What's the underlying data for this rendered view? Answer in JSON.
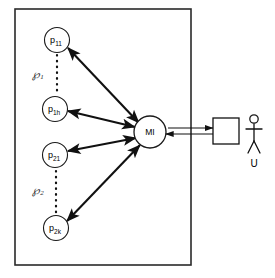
{
  "diagram": {
    "type": "node-link-diagram",
    "background_color": "#ffffff",
    "stroke_color": "#111111",
    "frame": {
      "name": "system-boundary",
      "x": 15,
      "y": 9,
      "width": 176,
      "height": 256
    },
    "provider_nodes": [
      {
        "id": "p11",
        "base": "p",
        "subscript": "11",
        "cx": 57,
        "cy": 40,
        "r": 12.5,
        "group": "P1"
      },
      {
        "id": "p1h",
        "base": "p",
        "subscript": "1h",
        "cx": 55,
        "cy": 109,
        "r": 12.5,
        "group": "P1"
      },
      {
        "id": "p21",
        "base": "p",
        "subscript": "21",
        "cx": 55,
        "cy": 155,
        "r": 12.5,
        "group": "P2"
      },
      {
        "id": "p2k",
        "base": "p",
        "subscript": "2k",
        "cx": 56,
        "cy": 228,
        "r": 12.5,
        "group": "P2"
      }
    ],
    "group_labels": [
      {
        "id": "P1",
        "base": "℘",
        "subscript": "1",
        "x": 38,
        "y": 74
      },
      {
        "id": "P2",
        "base": "℘",
        "subscript": "2",
        "x": 38,
        "y": 190
      }
    ],
    "ellipsis_links": [
      {
        "id": "dots-p1",
        "x": 57,
        "y1": 55,
        "y2": 95
      },
      {
        "id": "dots-p2",
        "x": 56,
        "y1": 170,
        "y2": 213
      }
    ],
    "mediator": {
      "id": "MI",
      "label": "MI",
      "cx": 150,
      "cy": 132,
      "r": 16
    },
    "edges": [
      {
        "id": "edge-p11-mi",
        "from": "p11",
        "to": "MI",
        "arrow": "bidirectional"
      },
      {
        "id": "edge-p1h-mi",
        "from": "p1h",
        "to": "MI",
        "arrow": "bidirectional"
      },
      {
        "id": "edge-p21-mi",
        "from": "p21",
        "to": "MI",
        "arrow": "bidirectional"
      },
      {
        "id": "edge-p2k-mi",
        "from": "p2k",
        "to": "MI",
        "arrow": "bidirectional"
      }
    ],
    "client_box": {
      "id": "client-application",
      "label": "",
      "x": 213,
      "y": 118,
      "width": 26,
      "height": 26
    },
    "client_connector": {
      "id": "mi-client-connector",
      "arrow": "bidirectional",
      "x_from": 166,
      "x_to": 213,
      "y_upper": 128,
      "y_lower": 134
    },
    "user": {
      "id": "user-actor",
      "label": "U",
      "cx": 254,
      "head_cy": 119,
      "head_r": 4.2,
      "body_top": 124,
      "body_bottom": 141,
      "arm_y": 129,
      "arm_span": 8,
      "leg_bottom": 153,
      "leg_span": 6,
      "label_y": 163
    }
  }
}
